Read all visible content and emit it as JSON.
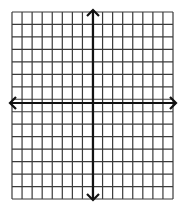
{
  "diagram": {
    "type": "coordinate-plane",
    "grid": {
      "columns": 16,
      "rows": 15,
      "left": 12,
      "top": 12,
      "right": 173,
      "bottom": 199,
      "line_color": "#3a3a3a",
      "background": "#ffffff"
    },
    "axes": {
      "color": "#111111",
      "x_axis": {
        "y": 103,
        "x_start": 10,
        "x_end": 176,
        "arrows": [
          "left",
          "right"
        ]
      },
      "y_axis": {
        "x": 93,
        "y_start": 10,
        "y_end": 200,
        "arrows": [
          "up",
          "down"
        ]
      }
    },
    "labels": []
  }
}
